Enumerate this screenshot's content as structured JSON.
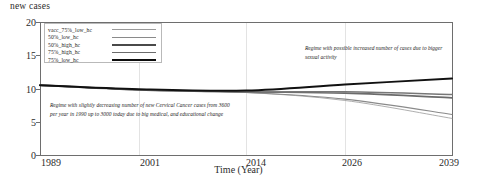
{
  "chart_data": {
    "type": "line",
    "title": "",
    "ylabel": "new cases",
    "xlabel": "Time (Year)",
    "ylim": [
      0,
      20
    ],
    "yticks": [
      0,
      5,
      10,
      15,
      20
    ],
    "xlim": [
      1989,
      2039
    ],
    "xticks": [
      1989,
      2001,
      2014,
      2026,
      2039
    ],
    "xtick_labels": [
      "1989",
      "2001",
      "2014",
      "2026",
      "2039"
    ],
    "ytick_labels": [
      "0",
      "5",
      "10",
      "15",
      "20"
    ],
    "grid": "vertical-faint",
    "legend_position": "top-left-inside",
    "x": [
      1989,
      2001,
      2014,
      2026,
      2039
    ],
    "series": [
      {
        "name": "vacc_75%_low_hc",
        "values": [
          10.5,
          9.8,
          9.4,
          8.2,
          5.5
        ],
        "color": "#9a9a9a",
        "width": 0.8
      },
      {
        "name": "50%_low_hc",
        "values": [
          10.5,
          9.8,
          9.4,
          8.4,
          6.1
        ],
        "color": "#8a8a8a",
        "width": 1.1
      },
      {
        "name": "50%_high_hc",
        "values": [
          10.5,
          9.8,
          9.5,
          9.3,
          8.6
        ],
        "color": "#6b6b6b",
        "width": 1.7
      },
      {
        "name": "75%_high_hc",
        "values": [
          10.5,
          9.8,
          9.5,
          9.5,
          9.1
        ],
        "color": "#777777",
        "width": 1.5
      },
      {
        "name": "75%_low_hc",
        "values": [
          10.5,
          9.9,
          9.7,
          10.6,
          11.5
        ],
        "color": "#111111",
        "width": 2.0
      }
    ],
    "annotations": [
      {
        "id": "left-regime",
        "text": "Regime with slightly decreasing number of new Cervical Cancer cases from 3600 per year in 1990 up to 3000 today due to big medical, and educational change"
      },
      {
        "id": "right-regime",
        "text": "Regime with possible increased number of cases due to bigger sexual activity"
      }
    ]
  },
  "legend": {
    "items": [
      {
        "label": "vacc_75%_low_hc"
      },
      {
        "label": "50%_low_hc"
      },
      {
        "label": "50%_high_hc"
      },
      {
        "label": "75%_high_hc"
      },
      {
        "label": "75%_low_hc"
      }
    ]
  }
}
